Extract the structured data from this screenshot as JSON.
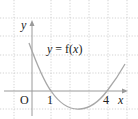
{
  "diagram": {
    "type": "function-graph",
    "function_label": "y = f(x)",
    "axis_labels": {
      "x": "x",
      "y": "y",
      "origin": "O"
    },
    "x_tick_labels": [
      "1",
      "4"
    ],
    "colors": {
      "grid": "#c8c8c8",
      "axis": "#9a9a9a",
      "curve": "#a8a8a8",
      "text": "#222222"
    }
  },
  "chart_data": {
    "type": "line",
    "title": "y = f(x)",
    "xlabel": "x",
    "ylabel": "y",
    "origin_label": "O",
    "x_ticks": [
      1,
      4
    ],
    "x_intercepts": [
      1,
      4
    ],
    "minimum": {
      "x": 2.5,
      "y": -1
    },
    "grid": true,
    "xlim": [
      -1,
      5
    ],
    "ylim": [
      -1,
      4
    ],
    "x": [
      -0.15,
      0.5,
      1,
      1.5,
      2,
      2.5,
      3,
      3.5,
      4,
      4.5,
      5.0
    ],
    "values": [
      2.6,
      1.1,
      0,
      -0.6,
      -0.9,
      -1,
      -0.9,
      -0.6,
      0,
      0.8,
      1.4
    ]
  }
}
